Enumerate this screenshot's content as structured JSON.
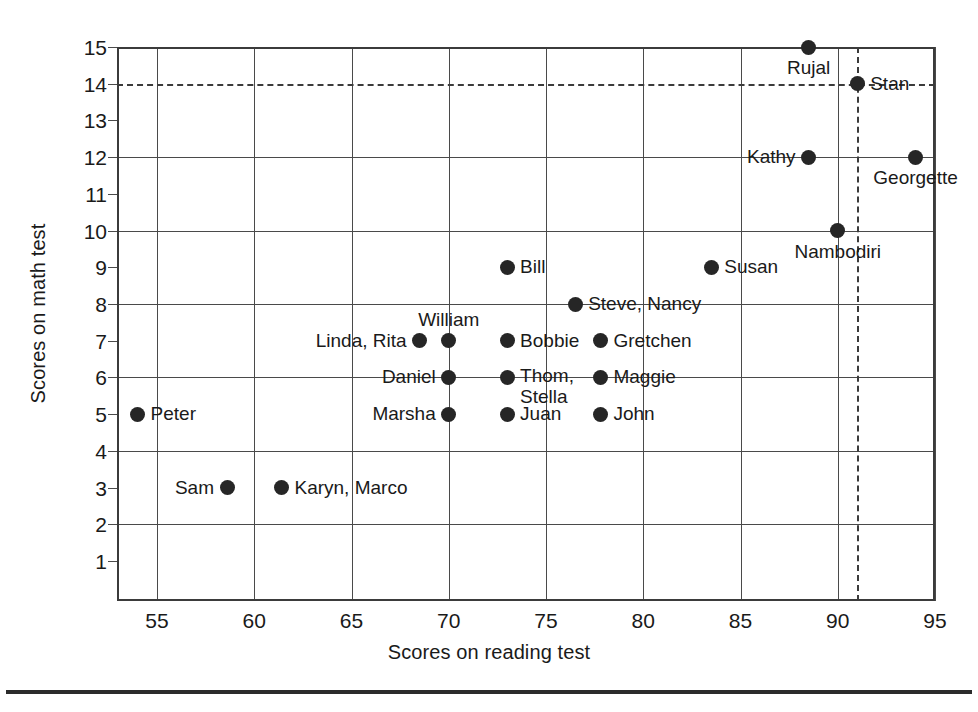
{
  "chart_data": {
    "type": "scatter",
    "title": "",
    "xlabel": "Scores on reading test",
    "ylabel": "Scores on math test",
    "xlim": [
      53,
      95
    ],
    "ylim": [
      0,
      15
    ],
    "x_ticks": [
      55,
      60,
      65,
      70,
      75,
      80,
      85,
      90,
      95
    ],
    "y_ticks": [
      1,
      2,
      3,
      4,
      5,
      6,
      7,
      8,
      9,
      10,
      11,
      12,
      13,
      14,
      15
    ],
    "x_gridlines": [
      55,
      60,
      65,
      70,
      75,
      80,
      85,
      90,
      95
    ],
    "y_gridlines": [
      2,
      4,
      6,
      8,
      10,
      12,
      15
    ],
    "reference_lines": [
      {
        "axis": "y",
        "value": 14,
        "style": "dashed"
      },
      {
        "axis": "x",
        "value": 91,
        "style": "dashed"
      }
    ],
    "grid": true,
    "legend": "none",
    "points": [
      {
        "label": "Peter",
        "x": 54.0,
        "y": 5,
        "label_pos": "right"
      },
      {
        "label": "Sam",
        "x": 58.6,
        "y": 3,
        "label_pos": "left"
      },
      {
        "label": "Karyn, Marco",
        "x": 61.4,
        "y": 3,
        "label_pos": "right"
      },
      {
        "label": "Linda, Rita",
        "x": 68.5,
        "y": 7,
        "label_pos": "left"
      },
      {
        "label": "William",
        "x": 70.0,
        "y": 7,
        "label_pos": "above"
      },
      {
        "label": "Daniel",
        "x": 70.0,
        "y": 6,
        "label_pos": "left"
      },
      {
        "label": "Marsha",
        "x": 70.0,
        "y": 5,
        "label_pos": "left"
      },
      {
        "label": "Bill",
        "x": 73.0,
        "y": 9,
        "label_pos": "right"
      },
      {
        "label": "Bobbie",
        "x": 73.0,
        "y": 7,
        "label_pos": "right"
      },
      {
        "label": "Thom,\nStella",
        "x": 73.0,
        "y": 6,
        "label_pos": "right-two"
      },
      {
        "label": "Juan",
        "x": 73.0,
        "y": 5,
        "label_pos": "right"
      },
      {
        "label": "Steve, Nancy",
        "x": 76.5,
        "y": 8,
        "label_pos": "right"
      },
      {
        "label": "Gretchen",
        "x": 77.8,
        "y": 7,
        "label_pos": "right"
      },
      {
        "label": "Maggie",
        "x": 77.8,
        "y": 6,
        "label_pos": "right"
      },
      {
        "label": "John",
        "x": 77.8,
        "y": 5,
        "label_pos": "right"
      },
      {
        "label": "Susan",
        "x": 83.5,
        "y": 9,
        "label_pos": "right"
      },
      {
        "label": "Rujal",
        "x": 88.5,
        "y": 15,
        "label_pos": "below"
      },
      {
        "label": "Kathy",
        "x": 88.5,
        "y": 12,
        "label_pos": "left"
      },
      {
        "label": "Nambodiri",
        "x": 90.0,
        "y": 10,
        "label_pos": "below"
      },
      {
        "label": "Stan",
        "x": 91.0,
        "y": 14,
        "label_pos": "right"
      },
      {
        "label": "Georgette",
        "x": 94.0,
        "y": 12,
        "label_pos": "below"
      }
    ]
  }
}
